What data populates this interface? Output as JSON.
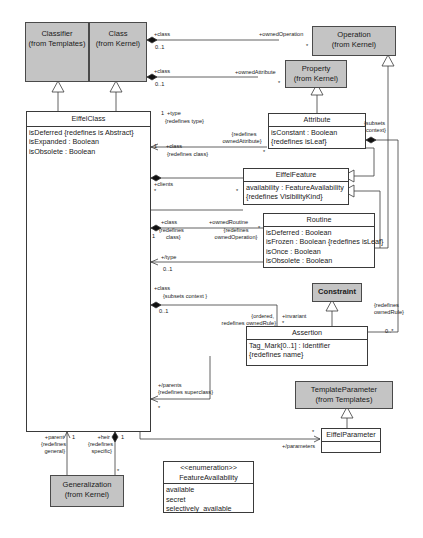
{
  "diagram": {
    "type": "UML class diagram",
    "classes": {
      "classifier": {
        "name": "Classifier",
        "package": "(from Templates)"
      },
      "class": {
        "name": "Class",
        "package": "(from Kernel)"
      },
      "operation": {
        "name": "Operation",
        "package": "(from Kernel)"
      },
      "property": {
        "name": "Property",
        "package": "(from Kernel)"
      },
      "eiffel_class": {
        "name": "EiffelClass",
        "attributes": [
          "isDeferred {redefines is Abstract}",
          "isExpanded : Boolean",
          "isObsolete : Boolean"
        ]
      },
      "attribute": {
        "name": "Attribute",
        "attributes": [
          "isConstant : Boolean",
          "{redefines isLeaf}"
        ]
      },
      "eiffel_feature": {
        "name": "EiffelFeature",
        "attributes": [
          "availability : FeatureAvailability",
          "{redefines VisibilityKind}"
        ]
      },
      "routine": {
        "name": "Routine",
        "attributes": [
          "isDeferred : Boolean",
          "isFrozen : Boolean {redefines isLeaf}",
          "isOnce : Boolean",
          "isObsolete : Boolean"
        ]
      },
      "constraint": {
        "name": "Constraint"
      },
      "assertion": {
        "name": "Assertion",
        "attributes": [
          "Tag_Mark[0..1] : Identifier",
          "{redefines name}"
        ]
      },
      "template_parameter": {
        "name": "TemplateParameter",
        "package": "(from Templates)"
      },
      "eiffel_parameter": {
        "name": "EiffelParameter"
      },
      "generalization": {
        "name": "Generalization",
        "package": "(from Kernel)"
      },
      "feature_availability": {
        "stereotype": "<<enumeration>>",
        "name": "FeatureAvailability",
        "literals": [
          "available",
          "secret",
          "selectively_available"
        ]
      }
    },
    "labels": {
      "op_class": "+class",
      "op_class_mult": "0..1",
      "op_owned": "+ownedOperation",
      "op_owned_mult": "*",
      "prop_class": "+class",
      "prop_class_mult": "0..1",
      "prop_owned": "+ownedAttribute",
      "prop_owned_mult": "*",
      "type_mult": "1",
      "type_role": "+type",
      "type_redef": "{redefines type}",
      "attr_class_mult": "1",
      "attr_class_role": "+class",
      "attr_class_redef": "{redefines class}",
      "attr_owned_redef1": "{redefines",
      "attr_owned_redef2": "ownedAttribute}",
      "attr_owned_mult": "*",
      "subsets_context1": "{subsets",
      "subsets_context2": "context}",
      "clients_role": "+clients",
      "clients_mult_left": "*",
      "clients_mult_right": "*",
      "rout_class_role": "+class",
      "rout_class_redef1": "{redefines",
      "rout_class_redef2": "class}",
      "rout_class_mult": "1",
      "rout_owned_role": "+ownedRoutine",
      "rout_owned_redef1": "{redefines",
      "rout_owned_redef2": "ownedOperation}",
      "rout_owned_mult": "*",
      "rout_type_role": "+/type",
      "rout_type_mult": "0..1",
      "assert_class_role": "+class",
      "assert_class_subsets": "{subsets context }",
      "assert_class_mult": "0..1",
      "assert_ordered1": "{ordered,",
      "assert_ordered2": "redefines ownedRule}",
      "invariant_role": "+invariant",
      "invariant_mult": "*",
      "owned_rule_redef1": "{redefines",
      "owned_rule_redef2": "ownedRule}",
      "owned_rule_mult": "0..*",
      "parents_role": "+/parents",
      "parents_redef": "{redefines superclass}",
      "parents_mult": "*",
      "parent_role": "+parent",
      "parent_redef1": "{redefines",
      "parent_redef2": "general}",
      "parent_mult": "1",
      "heir_role": "+heir",
      "heir_redef1": "{redefines",
      "heir_redef2": "specific}",
      "heir_mult": "1",
      "gen_mult": "*",
      "params_mult": "*",
      "params_role": "+/parameters"
    },
    "colors": {
      "gray_fill": "#c4c4c4",
      "line": "#3a3a3a",
      "background": "#ffffff"
    }
  }
}
